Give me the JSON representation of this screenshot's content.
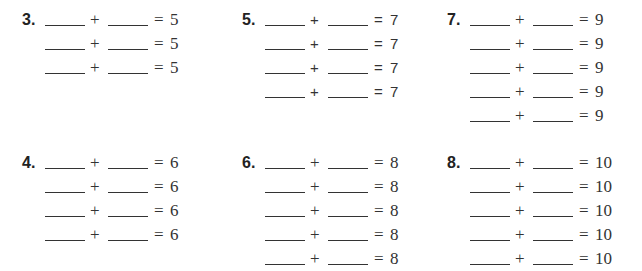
{
  "worksheet": {
    "problems": [
      {
        "number": "3.",
        "rows": [
          {
            "plus": "+",
            "equals": "=",
            "sum": "5"
          },
          {
            "plus": "+",
            "equals": "=",
            "sum": "5"
          },
          {
            "plus": "+",
            "equals": "=",
            "sum": "5"
          }
        ]
      },
      {
        "number": "5.",
        "rows": [
          {
            "plus": "+",
            "equals": "=",
            "sum": "7"
          },
          {
            "plus": "+",
            "equals": "=",
            "sum": "7"
          },
          {
            "plus": "+",
            "equals": "=",
            "sum": "7"
          },
          {
            "plus": "+",
            "equals": "=",
            "sum": "7"
          }
        ]
      },
      {
        "number": "7.",
        "rows": [
          {
            "plus": "+",
            "equals": "=",
            "sum": "9"
          },
          {
            "plus": "+",
            "equals": "=",
            "sum": "9"
          },
          {
            "plus": "+",
            "equals": "=",
            "sum": "9"
          },
          {
            "plus": "+",
            "equals": "=",
            "sum": "9"
          },
          {
            "plus": "+",
            "equals": "=",
            "sum": "9"
          }
        ]
      },
      {
        "number": "4.",
        "rows": [
          {
            "plus": "+",
            "equals": "=",
            "sum": "6"
          },
          {
            "plus": "+",
            "equals": "=",
            "sum": "6"
          },
          {
            "plus": "+",
            "equals": "=",
            "sum": "6"
          },
          {
            "plus": "+",
            "equals": "=",
            "sum": "6"
          }
        ]
      },
      {
        "number": "6.",
        "rows": [
          {
            "plus": "+",
            "equals": "=",
            "sum": "8"
          },
          {
            "plus": "+",
            "equals": "=",
            "sum": "8"
          },
          {
            "plus": "+",
            "equals": "=",
            "sum": "8"
          },
          {
            "plus": "+",
            "equals": "=",
            "sum": "8"
          },
          {
            "plus": "+",
            "equals": "=",
            "sum": "8"
          }
        ]
      },
      {
        "number": "8.",
        "rows": [
          {
            "plus": "+",
            "equals": "=",
            "sum": "10"
          },
          {
            "plus": "+",
            "equals": "=",
            "sum": "10"
          },
          {
            "plus": "+",
            "equals": "=",
            "sum": "10"
          },
          {
            "plus": "+",
            "equals": "=",
            "sum": "10"
          },
          {
            "plus": "+",
            "equals": "=",
            "sum": "10"
          }
        ]
      }
    ]
  }
}
